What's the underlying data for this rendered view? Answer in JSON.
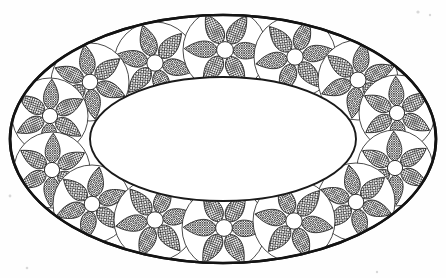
{
  "artwork": {
    "title": "Elliptical Ring With Rosettes",
    "style": "black-and-white line art",
    "background_color": "#fefefe",
    "line_color": "#131313",
    "fill_color": "#ffffff",
    "canvas": {
      "width": 446,
      "height": 278
    }
  },
  "outer_ellipse": {
    "name": "outer-ellipse",
    "cx": 223,
    "cy": 139,
    "rx": 213,
    "ry": 124,
    "stroke_width": 2.6,
    "stroke_color": "#131313"
  },
  "inner_ellipse": {
    "name": "inner-ellipse",
    "cx": 223,
    "cy": 139,
    "rx": 133,
    "ry": 62,
    "stroke_width": 1.9,
    "stroke_color": "#1a1a1a"
  },
  "rosette_style": {
    "petal_count": 6,
    "petal_fill": "crosshatch",
    "crosshatch_color": "#1d1d1d",
    "crosshatch_spacing": 2.4,
    "center_circle_radius_ratio": 0.2,
    "enclosing_circle_stroke": "#2a2a2a"
  },
  "rosettes": [
    {
      "id": 1,
      "label": "rosette-top-1",
      "cx": 155,
      "cy": 63,
      "r": 41,
      "rotation": 12
    },
    {
      "id": 2,
      "label": "rosette-top-2",
      "cx": 225,
      "cy": 50,
      "r": 42,
      "rotation": 2
    },
    {
      "id": 3,
      "label": "rosette-top-3",
      "cx": 295,
      "cy": 57,
      "r": 41,
      "rotation": -10
    },
    {
      "id": 4,
      "label": "rosette-top-left-1",
      "cx": 90,
      "cy": 82,
      "r": 39,
      "rotation": 22
    },
    {
      "id": 5,
      "label": "rosette-top-right-1",
      "cx": 358,
      "cy": 80,
      "r": 40,
      "rotation": -21
    },
    {
      "id": 6,
      "label": "rosette-left-upper",
      "cx": 50,
      "cy": 116,
      "r": 38,
      "rotation": 33
    },
    {
      "id": 7,
      "label": "rosette-right-upper",
      "cx": 397,
      "cy": 113,
      "r": 38,
      "rotation": -32
    },
    {
      "id": 8,
      "label": "rosette-left-lower",
      "cx": 52,
      "cy": 170,
      "r": 38,
      "rotation": -28
    },
    {
      "id": 9,
      "label": "rosette-right-lower",
      "cx": 395,
      "cy": 168,
      "r": 38,
      "rotation": 28
    },
    {
      "id": 10,
      "label": "rosette-bot-left-1",
      "cx": 92,
      "cy": 204,
      "r": 39,
      "rotation": -19
    },
    {
      "id": 11,
      "label": "rosette-bot-right-1",
      "cx": 356,
      "cy": 202,
      "r": 39,
      "rotation": 19
    },
    {
      "id": 12,
      "label": "rosette-bottom-1",
      "cx": 155,
      "cy": 220,
      "r": 41,
      "rotation": -9
    },
    {
      "id": 13,
      "label": "rosette-bottom-2",
      "cx": 224,
      "cy": 228,
      "r": 42,
      "rotation": 1
    },
    {
      "id": 14,
      "label": "rosette-bottom-3",
      "cx": 294,
      "cy": 221,
      "r": 41,
      "rotation": 10
    }
  ],
  "specks": [
    {
      "cx": 418,
      "cy": 12,
      "r": 1.6
    },
    {
      "cx": 430,
      "cy": 15,
      "r": 1.2
    },
    {
      "cx": 10,
      "cy": 196,
      "r": 1.4
    },
    {
      "cx": 27,
      "cy": 268,
      "r": 1.3
    },
    {
      "cx": 377,
      "cy": 272,
      "r": 1.2
    }
  ]
}
